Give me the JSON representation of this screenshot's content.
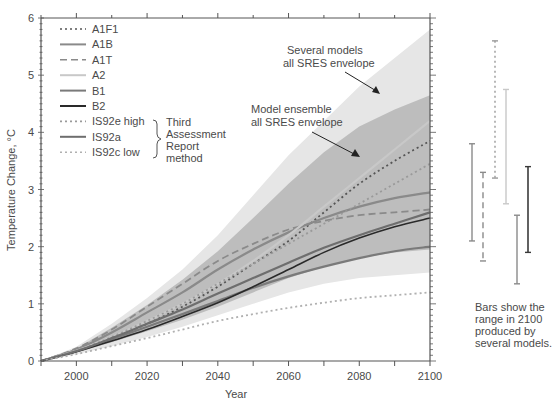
{
  "chart_data": {
    "type": "line",
    "title": "",
    "xlabel": "Year",
    "ylabel": "Temperature Change, °C",
    "xlim": [
      1990,
      2100
    ],
    "ylim": [
      0,
      6
    ],
    "x_ticks": [
      2000,
      2020,
      2040,
      2060,
      2080,
      2100
    ],
    "y_ticks": [
      0,
      1,
      2,
      3,
      4,
      5,
      6
    ],
    "grid": false,
    "legend_position": "upper-left",
    "x": [
      1990,
      2000,
      2010,
      2020,
      2030,
      2040,
      2050,
      2060,
      2070,
      2080,
      2090,
      2100
    ],
    "series": [
      {
        "name": "A1F1",
        "style": "dotted",
        "color": "#555555",
        "values": [
          0,
          0.18,
          0.4,
          0.65,
          0.95,
          1.3,
          1.7,
          2.1,
          2.6,
          3.1,
          3.5,
          3.85
        ]
      },
      {
        "name": "A1B",
        "style": "solid",
        "color": "#8a8a8a",
        "values": [
          0,
          0.2,
          0.5,
          0.85,
          1.2,
          1.6,
          1.95,
          2.25,
          2.5,
          2.7,
          2.85,
          2.95
        ]
      },
      {
        "name": "A1T",
        "style": "dashed",
        "color": "#8a8a8a",
        "values": [
          0,
          0.22,
          0.55,
          0.95,
          1.35,
          1.75,
          2.05,
          2.3,
          2.45,
          2.55,
          2.6,
          2.65
        ]
      },
      {
        "name": "A2",
        "style": "solid",
        "color": "#c8c8c8",
        "values": [
          0,
          0.18,
          0.42,
          0.7,
          1.0,
          1.35,
          1.75,
          2.2,
          2.7,
          3.2,
          3.7,
          4.2
        ]
      },
      {
        "name": "B1",
        "style": "solid",
        "color": "#7a7a7a",
        "values": [
          0,
          0.17,
          0.38,
          0.6,
          0.82,
          1.05,
          1.28,
          1.48,
          1.65,
          1.8,
          1.92,
          2.0
        ]
      },
      {
        "name": "B2",
        "style": "solid",
        "color": "#2a2a2a",
        "values": [
          0,
          0.16,
          0.35,
          0.55,
          0.78,
          1.02,
          1.3,
          1.6,
          1.9,
          2.15,
          2.35,
          2.5
        ]
      },
      {
        "name": "IS92e high",
        "style": "dotted",
        "color": "#9a9a9a",
        "values": [
          0,
          0.18,
          0.42,
          0.7,
          1.0,
          1.35,
          1.7,
          2.05,
          2.4,
          2.75,
          3.1,
          3.45
        ]
      },
      {
        "name": "IS92a",
        "style": "solid",
        "color": "#6e6e6e",
        "values": [
          0,
          0.17,
          0.4,
          0.65,
          0.9,
          1.18,
          1.45,
          1.72,
          1.98,
          2.2,
          2.4,
          2.6
        ]
      },
      {
        "name": "IS92c low",
        "style": "dotted",
        "color": "#b0b0b0",
        "values": [
          0,
          0.12,
          0.26,
          0.4,
          0.55,
          0.7,
          0.82,
          0.93,
          1.02,
          1.1,
          1.15,
          1.2
        ]
      }
    ],
    "envelopes": [
      {
        "name": "Several models all SRES envelope",
        "color": "#e6e6e6",
        "upper": [
          0,
          0.25,
          0.65,
          1.1,
          1.6,
          2.2,
          2.9,
          3.6,
          4.2,
          4.8,
          5.3,
          5.8
        ],
        "lower": [
          0,
          0.12,
          0.26,
          0.42,
          0.6,
          0.8,
          1.0,
          1.2,
          1.35,
          1.45,
          1.5,
          1.55
        ]
      },
      {
        "name": "Model ensemble all SRES envelope",
        "color": "#bdbdbd",
        "upper": [
          0,
          0.22,
          0.58,
          0.98,
          1.42,
          1.92,
          2.5,
          3.1,
          3.65,
          4.1,
          4.4,
          4.65
        ],
        "lower": [
          0,
          0.15,
          0.33,
          0.52,
          0.72,
          0.95,
          1.2,
          1.45,
          1.65,
          1.8,
          1.9,
          1.95
        ]
      }
    ],
    "range_bars_2100": [
      {
        "name": "A1B",
        "style": "solid",
        "color": "#8a8a8a",
        "low": 2.1,
        "high": 3.8
      },
      {
        "name": "A1T",
        "style": "dashed",
        "color": "#8a8a8a",
        "low": 1.75,
        "high": 3.3
      },
      {
        "name": "A1F1",
        "style": "dotted",
        "color": "#9a9a9a",
        "low": 3.2,
        "high": 5.6
      },
      {
        "name": "A2",
        "style": "solid",
        "color": "#c8c8c8",
        "low": 2.75,
        "high": 4.75
      },
      {
        "name": "B1",
        "style": "solid",
        "color": "#8a8a8a",
        "low": 1.35,
        "high": 2.55
      },
      {
        "name": "B2",
        "style": "solid",
        "color": "#3a3a3a",
        "low": 1.9,
        "high": 3.4
      }
    ],
    "annotations": [
      {
        "text": "Several models all SRES envelope",
        "arrow_to": [
          2072,
          4.55
        ]
      },
      {
        "text": "Model ensemble all SRES envelope",
        "arrow_to": [
          2071,
          3.55
        ]
      },
      {
        "text": "Third Assessment Report method",
        "brace_for": [
          "IS92e high",
          "IS92a",
          "IS92c low"
        ]
      },
      {
        "text": "Bars show the range in 2100 produced by several models."
      }
    ]
  },
  "labels": {
    "ylabel": "Temperature Change, °C",
    "xlabel": "Year",
    "yticks": [
      "0",
      "1",
      "2",
      "3",
      "4",
      "5",
      "6"
    ],
    "xticks": [
      "2000",
      "2020",
      "2040",
      "2060",
      "2080",
      "2100"
    ],
    "legend": [
      "A1F1",
      "A1B",
      "A1T",
      "A2",
      "B1",
      "B2",
      "IS92e high",
      "IS92a",
      "IS92c low"
    ],
    "brace_text": [
      "Third",
      "Assessment",
      "Report",
      "method"
    ],
    "ann_several": [
      "Several models",
      "all SRES envelope"
    ],
    "ann_ensemble": [
      "Model ensemble",
      "all SRES envelope"
    ],
    "bars_note": [
      "Bars show the",
      "range in 2100",
      "produced by",
      "several models."
    ]
  }
}
